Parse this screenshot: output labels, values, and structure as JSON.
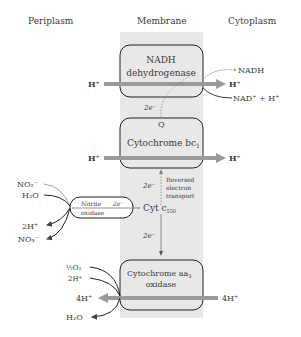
{
  "headers": {
    "periplasm": "Periplasm",
    "membrane": "Membrane",
    "cytoplasm": "Cytoplasm"
  },
  "complexes": {
    "nadh": {
      "line1": "NADH",
      "line2": "dehydrogenase"
    },
    "bc1": {
      "label": "Cytochrome bc",
      "sub": "1"
    },
    "aa3": {
      "label": "Cytochrome aa",
      "sub": "3",
      "line2": "oxidase"
    },
    "nitrite": {
      "line1": "Nitrite",
      "line2": "oxidase",
      "electrons": "2e⁻"
    }
  },
  "labels": {
    "h_plus": "H⁺",
    "nadh": "NADH",
    "nad_plus": "NAD⁺ + H⁺",
    "q": "Q",
    "two_e": "2e⁻",
    "reversed1": "Reversed",
    "reversed2": "electron",
    "reversed3": "transport",
    "cyt_c": "Cyt c",
    "cyt_c_sub": "550",
    "no2": "NO₂⁻",
    "h2o": "H₂O",
    "two_h": "2H⁺",
    "no3": "NO₃⁻",
    "half_o2": "½O₂",
    "four_h": "4H⁺"
  },
  "colors": {
    "membrane": "#e8e8e8",
    "proton_arrow": "#9a9a9a",
    "box_stroke": "#222222",
    "text": "#3a3a3a"
  }
}
